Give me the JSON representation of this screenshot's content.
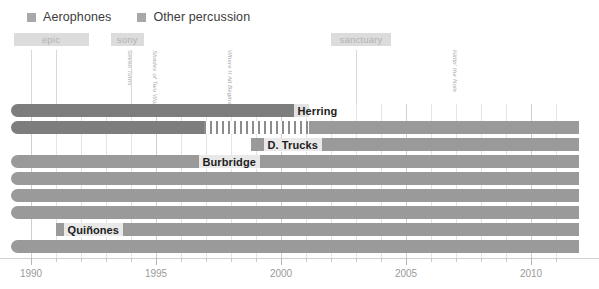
{
  "legend": {
    "items": [
      {
        "label": "Aerophones",
        "color": "#a8a8a8"
      },
      {
        "label": "Other percussion",
        "color": "#a8a8a8"
      }
    ]
  },
  "chart_data": {
    "type": "bar",
    "title": "",
    "xlabel": "",
    "ylabel": "",
    "xlim": [
      1989.2,
      2011.9
    ],
    "grid": true,
    "legend_position": "top-left",
    "axis": {
      "major_ticks": [
        1990,
        1995,
        2000,
        2005,
        2010
      ],
      "tick_labels": [
        "1990",
        "1995",
        "2000",
        "2005",
        "2010"
      ],
      "minor_tick_interval": 1
    },
    "eras": [
      {
        "label": "epic",
        "start": 1989.3,
        "end": 1992.3,
        "color": "#dcdcdc"
      },
      {
        "label": "sony",
        "start": 1993.2,
        "end": 1994.5,
        "color": "#dcdcdc"
      },
      {
        "label": "sanctuary",
        "start": 2002.0,
        "end": 2004.4,
        "color": "#dcdcdc"
      }
    ],
    "events": [
      {
        "label": "Seven Turns",
        "year": 1990.0
      },
      {
        "label": "Shades of Two Worlds",
        "year": 1991.0
      },
      {
        "label": "Where It All Begins",
        "year": 1994.0
      },
      {
        "label": "Hittin' the Note",
        "year": 2003.0
      }
    ],
    "categories": [
      "Herring",
      "Haynes",
      "D. Trucks",
      "Burbridge",
      "row-5",
      "row-6",
      "row-7",
      "Quinones",
      "row-9"
    ],
    "bars": [
      {
        "name": "Herring",
        "label": "Herring",
        "label_x": 2000.5,
        "segments": [
          {
            "start": 1989.2,
            "end": 2001.1,
            "style": "solid",
            "shade": "dark",
            "rounded_left": true
          }
        ]
      },
      {
        "name": "Haynes",
        "label": "",
        "label_x": null,
        "segments": [
          {
            "start": 1989.2,
            "end": 1996.9,
            "style": "solid",
            "shade": "dark",
            "rounded_left": true
          },
          {
            "start": 1996.9,
            "end": 2001.1,
            "style": "hatched",
            "shade": "dark",
            "rounded_left": false
          },
          {
            "start": 2001.1,
            "end": 2011.9,
            "style": "solid",
            "shade": "light",
            "rounded_left": false
          }
        ]
      },
      {
        "name": "D. Trucks",
        "label": "D. Trucks",
        "label_x": 1999.3,
        "segments": [
          {
            "start": 1998.8,
            "end": 2011.9,
            "style": "solid",
            "shade": "light",
            "rounded_left": false
          }
        ]
      },
      {
        "name": "Burbridge",
        "label": "Burbridge",
        "label_x": 1996.7,
        "segments": [
          {
            "start": 1989.2,
            "end": 2011.9,
            "style": "solid",
            "shade": "light",
            "rounded_left": true
          }
        ]
      },
      {
        "name": "row-5",
        "label": "",
        "label_x": null,
        "segments": [
          {
            "start": 1989.2,
            "end": 2011.9,
            "style": "solid",
            "shade": "light",
            "rounded_left": true
          }
        ]
      },
      {
        "name": "row-6",
        "label": "",
        "label_x": null,
        "segments": [
          {
            "start": 1989.2,
            "end": 2011.9,
            "style": "solid",
            "shade": "light",
            "rounded_left": true
          }
        ]
      },
      {
        "name": "row-7",
        "label": "",
        "label_x": null,
        "segments": [
          {
            "start": 1989.2,
            "end": 2011.9,
            "style": "solid",
            "shade": "light",
            "rounded_left": true
          }
        ]
      },
      {
        "name": "Quinones",
        "label": "Quiñones",
        "label_x": 1991.3,
        "segments": [
          {
            "start": 1991.0,
            "end": 2011.9,
            "style": "solid",
            "shade": "light",
            "rounded_left": false
          }
        ]
      },
      {
        "name": "row-9",
        "label": "",
        "label_x": null,
        "segments": [
          {
            "start": 1989.2,
            "end": 2011.9,
            "style": "solid",
            "shade": "light",
            "rounded_left": true
          }
        ]
      }
    ]
  }
}
